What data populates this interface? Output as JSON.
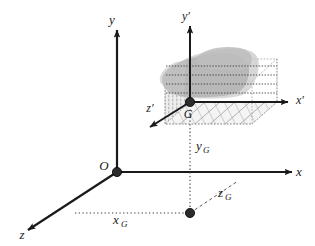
{
  "figure": {
    "type": "technical-line-diagram",
    "background_color": "#ffffff",
    "stroke_color": "#1a1a1a",
    "blob_fill": "#b5b5b5",
    "blob_fill_light": "#cccccc",
    "hatch_color": "#8c8c8c",
    "dotted_color": "#555555"
  },
  "global_frame": {
    "origin_label": "O",
    "axes": [
      {
        "name": "y-axis",
        "label": "y"
      },
      {
        "name": "x-axis",
        "label": "x"
      },
      {
        "name": "z-axis",
        "label": "z"
      }
    ]
  },
  "local_frame": {
    "origin_label": "G",
    "axes": [
      {
        "name": "y-prime-axis",
        "label": "y′"
      },
      {
        "name": "x-prime-axis",
        "label": "x′"
      },
      {
        "name": "z-prime-axis",
        "label": "z′"
      }
    ]
  },
  "coordinates": [
    {
      "name": "x-g",
      "base": "x",
      "sub": "G"
    },
    {
      "name": "y-g",
      "base": "y",
      "sub": "G"
    },
    {
      "name": "z-g",
      "base": "z",
      "sub": "G"
    }
  ],
  "nodes": [
    {
      "name": "origin-node-o",
      "x": 117,
      "y": 172
    },
    {
      "name": "local-origin-node-g",
      "x": 190,
      "y": 102
    },
    {
      "name": "projection-node-ground",
      "x": 190,
      "y": 213
    }
  ]
}
